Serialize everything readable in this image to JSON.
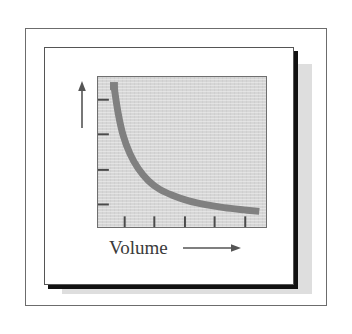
{
  "figure": {
    "name": "pressure-volume-curve-figure",
    "background_color": "#ffffff",
    "frame_border_color": "#6c6c6c",
    "card_color": "#ffffff",
    "card_shadow_color": "#111111",
    "pale_shadow_color": "#dedede"
  },
  "chart_data": {
    "type": "line",
    "title": "",
    "subtitle": "",
    "xlabel": "Volume",
    "ylabel": "Pressure",
    "xlabel_arrow": "right-arrow",
    "ylabel_arrow": "up-arrow",
    "axis_tick_labels_x": [],
    "axis_tick_labels_y": [],
    "x_tick_count": 5,
    "y_tick_count": 4,
    "grid": false,
    "legend": "none",
    "xlim": [
      0,
      10
    ],
    "ylim": [
      0,
      10
    ],
    "plot_background_color": "#d6d6d6",
    "plot_border_color": "#6f6f6f",
    "curve_color": "#808080",
    "curve_width_px": 7,
    "relationship": "P = k / V (inverse proportion, Boyle's Law)",
    "series": [
      {
        "name": "Pressure vs Volume",
        "x": [
          0.95,
          1.2,
          1.5,
          1.9,
          2.4,
          3.0,
          3.7,
          4.5,
          5.4,
          6.4,
          7.5,
          8.7,
          9.6
        ],
        "y": [
          9.4,
          7.6,
          6.1,
          4.9,
          3.9,
          3.1,
          2.5,
          2.1,
          1.75,
          1.5,
          1.3,
          1.15,
          1.05
        ]
      }
    ]
  }
}
